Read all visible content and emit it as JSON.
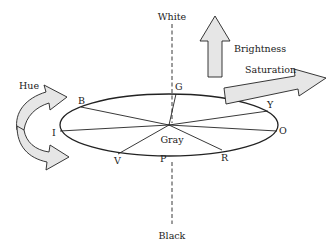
{
  "diagram": {
    "axis": {
      "top_label": "White",
      "bottom_label": "Black",
      "center_label": "Gray"
    },
    "arrows": {
      "hue": "Hue",
      "brightness": "Brightness",
      "saturation": "Saturation"
    },
    "hues": [
      {
        "key": "B",
        "label": "B",
        "name": "Blue"
      },
      {
        "key": "G",
        "label": "G",
        "name": "Green"
      },
      {
        "key": "Y",
        "label": "Y",
        "name": "Yellow"
      },
      {
        "key": "O",
        "label": "O",
        "name": "Orange"
      },
      {
        "key": "R",
        "label": "R",
        "name": "Red"
      },
      {
        "key": "P",
        "label": "P",
        "name": "Purple"
      },
      {
        "key": "V",
        "label": "V",
        "name": "Violet"
      },
      {
        "key": "I",
        "label": "I",
        "name": "Indigo"
      }
    ],
    "colors": {
      "stroke": "#222222",
      "arrow_fill": "#e6e6e6",
      "background": "#ffffff"
    }
  }
}
